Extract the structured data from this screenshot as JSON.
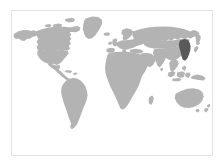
{
  "figure": {
    "kind": "world-locator-map",
    "projection": "equirectangular",
    "title": "",
    "caption": "",
    "width": 224,
    "height": 166
  },
  "colors": {
    "background": "#ffffff",
    "frame_border": "#e2e2e2",
    "land": "#b3b3b3",
    "highlight": "#595959",
    "ocean": "#ffffff"
  },
  "frame": {
    "left": 11,
    "top": 10,
    "width": 202,
    "height": 146,
    "border_width": 1
  },
  "highlight": {
    "region_name": "Korean Peninsula / Northeast Asia",
    "continent": "Asia",
    "color": "#595959",
    "label": "",
    "center_x": 179,
    "center_y": 60
  },
  "landmasses": [
    {
      "name": "North America",
      "color": "#b3b3b3"
    },
    {
      "name": "South America",
      "color": "#b3b3b3"
    },
    {
      "name": "Greenland",
      "color": "#b3b3b3"
    },
    {
      "name": "Iceland",
      "color": "#b3b3b3"
    },
    {
      "name": "Europe",
      "color": "#b3b3b3"
    },
    {
      "name": "Africa",
      "color": "#b3b3b3"
    },
    {
      "name": "Asia",
      "color": "#b3b3b3"
    },
    {
      "name": "Indonesia",
      "color": "#b3b3b3"
    },
    {
      "name": "Japan",
      "color": "#b3b3b3"
    },
    {
      "name": "Australia",
      "color": "#b3b3b3"
    },
    {
      "name": "New Zealand",
      "color": "#b3b3b3"
    },
    {
      "name": "Madagascar",
      "color": "#b3b3b3"
    },
    {
      "name": "British Isles",
      "color": "#b3b3b3"
    },
    {
      "name": "Caribbean",
      "color": "#b3b3b3"
    },
    {
      "name": "Sri Lanka",
      "color": "#b3b3b3"
    },
    {
      "name": "Philippines",
      "color": "#b3b3b3"
    }
  ],
  "chart_data": {
    "type": "map",
    "title": "",
    "xlabel": "",
    "ylabel": "",
    "projection": "equirectangular",
    "lon_range": [
      -180,
      180
    ],
    "lat_range": [
      -60,
      84
    ],
    "grid": false,
    "legend": "none",
    "series": [
      {
        "name": "All countries",
        "style": "fill",
        "color": "#b3b3b3",
        "values": 1
      },
      {
        "name": "Highlighted country",
        "style": "fill",
        "color": "#595959",
        "values": 1,
        "location_label": "Korean Peninsula / Northeast Asia"
      }
    ]
  }
}
